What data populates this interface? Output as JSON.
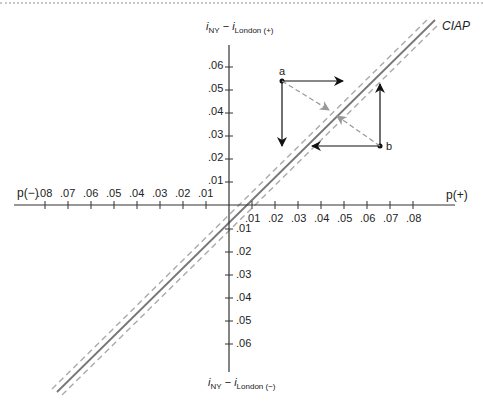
{
  "diagram": {
    "title_line": "CIAP",
    "y_axis_top_label": {
      "main1": "i",
      "sub1": "NY",
      "minus": " − ",
      "main2": "i",
      "sub2": "London (+)"
    },
    "y_axis_bottom_label": {
      "main1": "i",
      "sub1": "NY",
      "minus": " − ",
      "main2": "i",
      "sub2": "London (−)"
    },
    "x_axis_left_label": "p(−)",
    "x_axis_right_label": "p(+)",
    "x_ticks_positive": [
      ".01",
      ".02",
      ".03",
      ".04",
      ".05",
      ".06",
      ".07",
      ".08"
    ],
    "x_ticks_negative": [
      ".01",
      ".02",
      ".03",
      ".04",
      ".05",
      ".06",
      ".07",
      ".08"
    ],
    "y_ticks_positive": [
      ".01",
      ".02",
      ".03",
      ".04",
      ".05",
      ".06"
    ],
    "y_ticks_negative": [
      ".01",
      ".02",
      ".03",
      ".04",
      ".05",
      ".06"
    ],
    "points": [
      {
        "label": "a",
        "x": 0.025,
        "y": 0.053
      },
      {
        "label": "b",
        "x": 0.066,
        "y": 0.025
      }
    ],
    "colors": {
      "axis": "#333333",
      "ciap_line": "#777777",
      "band_dashes": "#aaaaaa",
      "arrows": "#111111",
      "dashed_arrows": "#999999"
    }
  }
}
